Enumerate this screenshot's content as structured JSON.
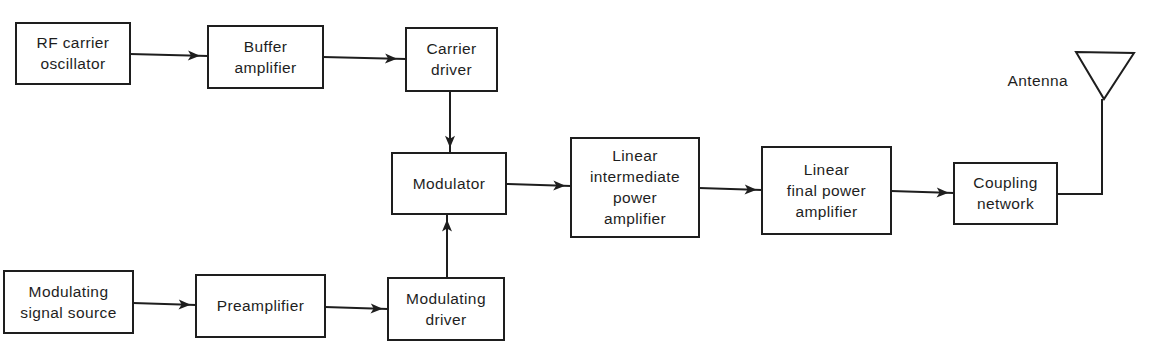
{
  "diagram": {
    "stroke_color": "#1e1e1e",
    "background": "#ffffff",
    "blocks": [
      {
        "id": "rf-carrier-oscillator",
        "lines": [
          "RF carrier",
          "oscillator"
        ],
        "x": 16,
        "y": 23,
        "w": 114,
        "h": 61
      },
      {
        "id": "buffer-amplifier",
        "lines": [
          "Buffer",
          "amplifier"
        ],
        "x": 208,
        "y": 26,
        "w": 115,
        "h": 62
      },
      {
        "id": "carrier-driver",
        "lines": [
          "Carrier",
          "driver"
        ],
        "x": 406,
        "y": 28,
        "w": 91,
        "h": 63
      },
      {
        "id": "modulator",
        "lines": [
          "Modulator"
        ],
        "x": 392,
        "y": 153,
        "w": 114,
        "h": 61
      },
      {
        "id": "linear-intermediate-power-amplifier",
        "lines": [
          "Linear",
          "intermediate",
          "power",
          "amplifier"
        ],
        "x": 571,
        "y": 138,
        "w": 128,
        "h": 99
      },
      {
        "id": "linear-final-power-amplifier",
        "lines": [
          "Linear",
          "final power",
          "amplifier"
        ],
        "x": 762,
        "y": 147,
        "w": 129,
        "h": 87
      },
      {
        "id": "coupling-network",
        "lines": [
          "Coupling",
          "network"
        ],
        "x": 954,
        "y": 163,
        "w": 103,
        "h": 61
      },
      {
        "id": "modulating-signal-source",
        "lines": [
          "Modulating",
          "signal source"
        ],
        "x": 4,
        "y": 271,
        "w": 129,
        "h": 62
      },
      {
        "id": "preamplifier",
        "lines": [
          "Preamplifier"
        ],
        "x": 196,
        "y": 275,
        "w": 129,
        "h": 62
      },
      {
        "id": "modulating-driver",
        "lines": [
          "Modulating",
          "driver"
        ],
        "x": 388,
        "y": 278,
        "w": 116,
        "h": 62
      }
    ],
    "connections": [
      {
        "from": "rf-carrier-oscillator",
        "to": "buffer-amplifier",
        "points": [
          [
            130,
            54
          ],
          [
            208,
            56
          ]
        ]
      },
      {
        "from": "buffer-amplifier",
        "to": "carrier-driver",
        "points": [
          [
            323,
            57
          ],
          [
            406,
            59
          ]
        ]
      },
      {
        "from": "carrier-driver",
        "to": "modulator",
        "points": [
          [
            450,
            91
          ],
          [
            450,
            153
          ]
        ]
      },
      {
        "from": "modulating-driver",
        "to": "modulator",
        "points": [
          [
            447,
            278
          ],
          [
            447,
            214
          ]
        ]
      },
      {
        "from": "modulator",
        "to": "linear-intermediate-power-amplifier",
        "points": [
          [
            506,
            184
          ],
          [
            571,
            186
          ]
        ]
      },
      {
        "from": "linear-intermediate-power-amplifier",
        "to": "linear-final-power-amplifier",
        "points": [
          [
            699,
            188
          ],
          [
            762,
            190
          ]
        ]
      },
      {
        "from": "linear-final-power-amplifier",
        "to": "coupling-network",
        "points": [
          [
            891,
            191
          ],
          [
            954,
            193
          ]
        ]
      },
      {
        "from": "modulating-signal-source",
        "to": "preamplifier",
        "points": [
          [
            133,
            303
          ],
          [
            196,
            305
          ]
        ]
      },
      {
        "from": "preamplifier",
        "to": "modulating-driver",
        "points": [
          [
            325,
            307
          ],
          [
            388,
            309
          ]
        ]
      }
    ],
    "antenna": {
      "label": "Antenna",
      "label_x": 1068,
      "label_y": 86,
      "triangle": [
        [
          1076,
          52
        ],
        [
          1134,
          53
        ],
        [
          1104,
          99
        ]
      ],
      "feed": [
        [
          1057,
          194
        ],
        [
          1102,
          194
        ],
        [
          1102,
          99
        ]
      ]
    }
  }
}
